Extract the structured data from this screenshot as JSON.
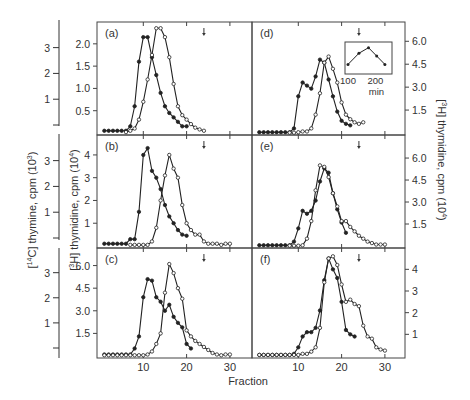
{
  "figure": {
    "x_label": "Fraction",
    "left_outer_axis_label": "[14C] thymine, cpm (10^3)",
    "left_inner_axis_label": "[3H] thymidine, cpm (10^4)",
    "right_axis_label": "[3H] thymidine, cpm (10^4)",
    "x_ticks": [
      "10",
      "20",
      "30"
    ],
    "outer_left_ticks": {
      "top": [
        "1",
        "2",
        "3"
      ],
      "middle": [
        "1",
        "2",
        "3"
      ],
      "bottom": [
        "1",
        "2",
        "3"
      ]
    },
    "inset": {
      "x_ticks": [
        "100",
        "200"
      ],
      "x_label": "min",
      "values": [
        [
          100,
          1
        ],
        [
          140,
          3
        ],
        [
          175,
          4
        ],
        [
          205,
          2.5
        ],
        [
          235,
          1
        ]
      ]
    }
  },
  "chart_data": [
    {
      "panel": "(a)",
      "type": "line",
      "xlabel": "Fraction",
      "ylabel": "[3H] thymidine, cpm (10^4)",
      "yticks": [
        "0.5",
        "1.0",
        "1.5",
        "2.0"
      ],
      "ylim": [
        0,
        2.4
      ],
      "arrow_at_fraction": 24,
      "series": [
        {
          "name": "closed",
          "marker": "filled",
          "x": [
            1,
            2,
            3,
            4,
            5,
            6,
            7,
            8,
            9,
            10,
            11,
            12,
            13,
            14,
            15,
            16,
            17,
            18,
            19,
            20
          ],
          "y": [
            0.05,
            0.05,
            0.05,
            0.05,
            0.05,
            0.05,
            0.15,
            0.6,
            1.6,
            2.15,
            2.15,
            1.7,
            1.3,
            0.9,
            0.6,
            0.45,
            0.35,
            0.25,
            0.15,
            0.15
          ]
        },
        {
          "name": "open",
          "marker": "open",
          "x": [
            6,
            7,
            8,
            9,
            10,
            11,
            12,
            13,
            14,
            15,
            16,
            17,
            18,
            19,
            20,
            21,
            22,
            23,
            24
          ],
          "y": [
            0.02,
            0.05,
            0.1,
            0.3,
            0.7,
            1.2,
            1.75,
            2.35,
            2.35,
            2.15,
            1.7,
            1.1,
            0.6,
            0.4,
            0.3,
            0.2,
            0.12,
            0.08,
            0.05
          ]
        }
      ]
    },
    {
      "panel": "(b)",
      "type": "line",
      "xlabel": "Fraction",
      "ylabel": "[3H] thymidine, cpm (10^4)",
      "yticks": [
        "1",
        "2",
        "3",
        "4"
      ],
      "ylim": [
        0,
        4.7
      ],
      "arrow_at_fraction": 24,
      "series": [
        {
          "name": "closed",
          "marker": "filled",
          "x": [
            1,
            2,
            3,
            4,
            5,
            6,
            7,
            8,
            9,
            10,
            11,
            12,
            13,
            14,
            15,
            16,
            17,
            18,
            19,
            20
          ],
          "y": [
            0.1,
            0.1,
            0.1,
            0.1,
            0.1,
            0.1,
            0.3,
            0.3,
            1.5,
            4.0,
            4.3,
            3.3,
            3.0,
            2.5,
            1.8,
            1.3,
            1.0,
            0.7,
            0.5,
            0.45
          ]
        },
        {
          "name": "open",
          "marker": "open",
          "x": [
            7,
            8,
            9,
            10,
            11,
            12,
            13,
            14,
            15,
            16,
            17,
            18,
            19,
            20,
            21,
            22,
            23,
            24,
            25,
            26,
            27,
            28,
            29,
            30
          ],
          "y": [
            0.05,
            0.05,
            0.05,
            0.05,
            0.05,
            0.2,
            0.8,
            2.0,
            3.1,
            4.0,
            3.4,
            3.0,
            1.8,
            1.0,
            0.7,
            0.5,
            0.5,
            0.2,
            0.1,
            0.1,
            0.1,
            0.05,
            0.1,
            0.1
          ]
        }
      ]
    },
    {
      "panel": "(c)",
      "type": "line",
      "xlabel": "Fraction",
      "ylabel": "[3H] thymidine, cpm (10^4)",
      "yticks": [
        "1.5",
        "3.0",
        "4.5",
        "6.0"
      ],
      "ylim": [
        0,
        6.9
      ],
      "arrow_at_fraction": 24,
      "series": [
        {
          "name": "closed",
          "marker": "filled",
          "x": [
            1,
            2,
            3,
            4,
            5,
            6,
            7,
            8,
            9,
            10,
            11,
            12,
            13,
            14,
            15,
            16,
            17,
            18,
            19,
            20,
            21
          ],
          "y": [
            0.1,
            0.1,
            0.1,
            0.1,
            0.1,
            0.1,
            0.1,
            0.5,
            1.3,
            3.9,
            5.1,
            5.0,
            3.9,
            3.6,
            3.0,
            3.4,
            2.6,
            2.2,
            1.9,
            0.8,
            0.5
          ]
        },
        {
          "name": "open",
          "marker": "open",
          "x": [
            1,
            2,
            3,
            4,
            5,
            6,
            7,
            8,
            9,
            10,
            11,
            12,
            13,
            14,
            15,
            16,
            17,
            18,
            19,
            20,
            21,
            22,
            23,
            24,
            25,
            26,
            27,
            28,
            29,
            30
          ],
          "y": [
            0.05,
            0.05,
            0.05,
            0.05,
            0.05,
            0.05,
            0.05,
            0.05,
            0.05,
            0.05,
            0.1,
            0.3,
            0.8,
            1.5,
            4.2,
            6.1,
            5.5,
            4.5,
            3.8,
            1.7,
            1.3,
            1.0,
            0.8,
            0.6,
            0.4,
            0.2,
            0.1,
            0.05,
            0.1,
            0.1
          ]
        }
      ]
    },
    {
      "panel": "(d)",
      "type": "line",
      "xlabel": "Fraction",
      "ylabel": "[3H] thymidine, cpm (10^4)",
      "yticks": [
        "1.5",
        "3.0",
        "4.5",
        "6.0"
      ],
      "ylim": [
        0,
        7.0
      ],
      "arrow_at_fraction": 24,
      "right_axis": true,
      "series": [
        {
          "name": "closed",
          "marker": "filled",
          "x": [
            1,
            2,
            3,
            4,
            5,
            6,
            7,
            8,
            9,
            10,
            11,
            12,
            13,
            14,
            15,
            16,
            17,
            18,
            19,
            20,
            21,
            22
          ],
          "y": [
            0.05,
            0.05,
            0.05,
            0.05,
            0.05,
            0.05,
            0.05,
            0.05,
            0.3,
            2.4,
            3.3,
            3.1,
            2.9,
            3.7,
            4.8,
            4.6,
            3.5,
            2.4,
            1.4,
            0.8,
            0.6,
            0.5
          ]
        },
        {
          "name": "open",
          "marker": "open",
          "x": [
            8,
            9,
            10,
            11,
            12,
            13,
            14,
            15,
            16,
            17,
            18,
            19,
            20,
            21,
            22,
            23,
            24,
            25
          ],
          "y": [
            0.02,
            0.02,
            0.05,
            0.1,
            0.1,
            0.3,
            1.2,
            2.6,
            4.6,
            5.0,
            4.2,
            3.3,
            2.0,
            1.2,
            0.9,
            0.7,
            0.6,
            0.7
          ]
        }
      ]
    },
    {
      "panel": "(e)",
      "type": "line",
      "xlabel": "Fraction",
      "ylabel": "[3H] thymidine, cpm (10^4)",
      "yticks": [
        "1.5",
        "3.0",
        "4.5",
        "6.0"
      ],
      "ylim": [
        0,
        7.3
      ],
      "arrow_at_fraction": 24,
      "right_axis": true,
      "series": [
        {
          "name": "closed",
          "marker": "filled",
          "x": [
            1,
            2,
            3,
            4,
            5,
            6,
            7,
            8,
            9,
            10,
            11,
            12,
            13,
            14,
            15,
            16,
            17,
            18,
            19,
            20,
            21
          ],
          "y": [
            0.05,
            0.05,
            0.05,
            0.05,
            0.05,
            0.05,
            0.05,
            0.05,
            0.3,
            1.2,
            2.4,
            2.2,
            2.4,
            3.1,
            4.4,
            5.3,
            5.0,
            3.6,
            2.5,
            1.6,
            0.9
          ]
        },
        {
          "name": "open",
          "marker": "open",
          "x": [
            8,
            9,
            10,
            11,
            12,
            13,
            14,
            15,
            16,
            17,
            18,
            19,
            20,
            21,
            22,
            23,
            24,
            25,
            26,
            27,
            28,
            29,
            30
          ],
          "y": [
            0.02,
            0.02,
            0.02,
            0.05,
            0.5,
            1.7,
            3.8,
            5.5,
            5.4,
            4.7,
            3.6,
            2.7,
            1.7,
            1.7,
            1.3,
            1.0,
            0.7,
            0.5,
            0.3,
            0.2,
            0.1,
            0.1,
            0.1
          ]
        }
      ]
    },
    {
      "panel": "(f)",
      "type": "line",
      "xlabel": "Fraction",
      "ylabel": "[14C] thymine, cpm (10^3)",
      "yticks": [
        "1",
        "2",
        "3",
        "4"
      ],
      "ylim": [
        0,
        4.8
      ],
      "arrow_at_fraction": 24,
      "right_axis": true,
      "series": [
        {
          "name": "closed",
          "marker": "filled",
          "x": [
            1,
            2,
            3,
            4,
            5,
            6,
            7,
            8,
            9,
            10,
            11,
            12,
            13,
            14,
            15,
            16,
            17,
            18,
            19,
            20,
            21,
            22,
            23
          ],
          "y": [
            0.05,
            0.05,
            0.05,
            0.05,
            0.05,
            0.05,
            0.05,
            0.05,
            0.1,
            0.4,
            0.9,
            1.1,
            1.1,
            1.3,
            2.1,
            3.5,
            4.5,
            4.0,
            3.6,
            2.5,
            1.2,
            1.0,
            0.9
          ]
        },
        {
          "name": "open",
          "marker": "open",
          "x": [
            1,
            2,
            3,
            4,
            5,
            6,
            7,
            8,
            9,
            10,
            11,
            12,
            13,
            14,
            15,
            16,
            17,
            18,
            19,
            20,
            21,
            22,
            23,
            24,
            25,
            26,
            27,
            28,
            29,
            30
          ],
          "y": [
            0.05,
            0.05,
            0.05,
            0.05,
            0.05,
            0.05,
            0.05,
            0.05,
            0.05,
            0.05,
            0.1,
            0.1,
            0.2,
            0.4,
            1.3,
            3.4,
            4.5,
            4.6,
            4.2,
            3.3,
            2.5,
            2.6,
            2.4,
            2.3,
            1.4,
            0.9,
            0.8,
            0.4,
            0.3,
            0.25
          ]
        }
      ]
    }
  ]
}
